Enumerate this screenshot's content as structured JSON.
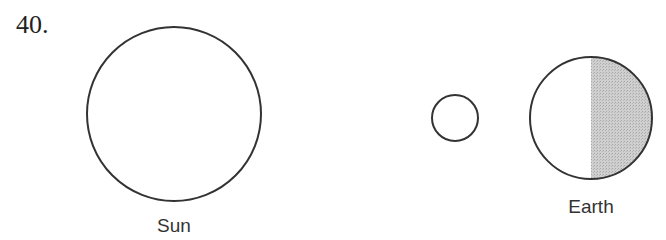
{
  "question": {
    "number": "40."
  },
  "diagram": {
    "bodies": [
      {
        "name": "sun",
        "label": "Sun",
        "cx": 174,
        "cy": 114,
        "r": 87,
        "shaded": false
      },
      {
        "name": "moon",
        "label": "",
        "cx": 455,
        "cy": 118,
        "r": 23,
        "shaded": false
      },
      {
        "name": "earth",
        "label": "Earth",
        "cx": 591,
        "cy": 118,
        "r": 61,
        "shaded": "right-half"
      }
    ],
    "labels": {
      "sun": "Sun",
      "earth": "Earth"
    },
    "colors": {
      "outline": "#333333",
      "shade": "#c8c8c8"
    }
  }
}
